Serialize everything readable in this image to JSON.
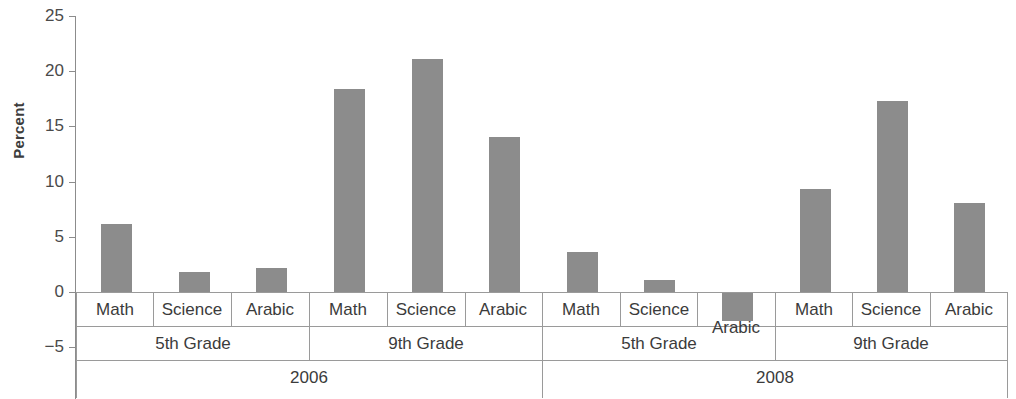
{
  "chart_data": {
    "type": "bar",
    "title": "",
    "xlabel": "",
    "ylabel": "Percent",
    "ylim": [
      -7.5,
      25
    ],
    "yticks": [
      -5,
      0,
      5,
      10,
      15,
      20,
      25
    ],
    "ytick_labels": [
      "−5",
      "0",
      "5",
      "10",
      "15",
      "20",
      "25"
    ],
    "grid": false,
    "legend": "none",
    "bar_color": "#8c8c8c",
    "axis_color": "#8c8c8c",
    "categories": [
      "2006 / 5th Grade / Math",
      "2006 / 5th Grade / Science",
      "2006 / 5th Grade / Arabic",
      "2006 / 9th Grade / Math",
      "2006 / 9th Grade / Science",
      "2006 / 9th Grade / Arabic",
      "2008 / 5th Grade / Math",
      "2008 / 5th Grade / Science",
      "2008 / 5th Grade / Arabic",
      "2008 / 9th Grade / Math",
      "2008 / 9th Grade / Science",
      "2008 / 9th Grade / Arabic"
    ],
    "values": [
      6.2,
      1.8,
      2.2,
      18.4,
      21.1,
      14.0,
      3.6,
      1.1,
      -2.6,
      9.3,
      17.3,
      8.1
    ],
    "groups": [
      {
        "year": "2006",
        "grades": [
          {
            "grade": "5th Grade",
            "subjects": [
              "Math",
              "Science",
              "Arabic"
            ],
            "values": [
              6.2,
              1.8,
              2.2
            ]
          },
          {
            "grade": "9th Grade",
            "subjects": [
              "Math",
              "Science",
              "Arabic"
            ],
            "values": [
              18.4,
              21.1,
              14.0
            ]
          }
        ]
      },
      {
        "year": "2008",
        "grades": [
          {
            "grade": "5th Grade",
            "subjects": [
              "Math",
              "Science",
              "Arabic"
            ],
            "values": [
              3.6,
              1.1,
              -2.6
            ]
          },
          {
            "grade": "9th Grade",
            "subjects": [
              "Math",
              "Science",
              "Arabic"
            ],
            "values": [
              9.3,
              17.3,
              8.1
            ]
          }
        ]
      }
    ]
  },
  "axis": {
    "title": "Percent",
    "ticks": [
      {
        "label": "25",
        "value": 25
      },
      {
        "label": "20",
        "value": 20
      },
      {
        "label": "15",
        "value": 15
      },
      {
        "label": "10",
        "value": 10
      },
      {
        "label": "5",
        "value": 5
      },
      {
        "label": "0",
        "value": 0
      },
      {
        "label": "−5",
        "value": -5
      }
    ]
  },
  "labels": {
    "subjects": [
      "Math",
      "Science",
      "Arabic",
      "Math",
      "Science",
      "Arabic",
      "Math",
      "Science",
      "Arabic",
      "Math",
      "Science",
      "Arabic"
    ],
    "grades": [
      "5th Grade",
      "9th Grade",
      "5th Grade",
      "9th Grade"
    ],
    "years": [
      "2006",
      "2008"
    ]
  }
}
